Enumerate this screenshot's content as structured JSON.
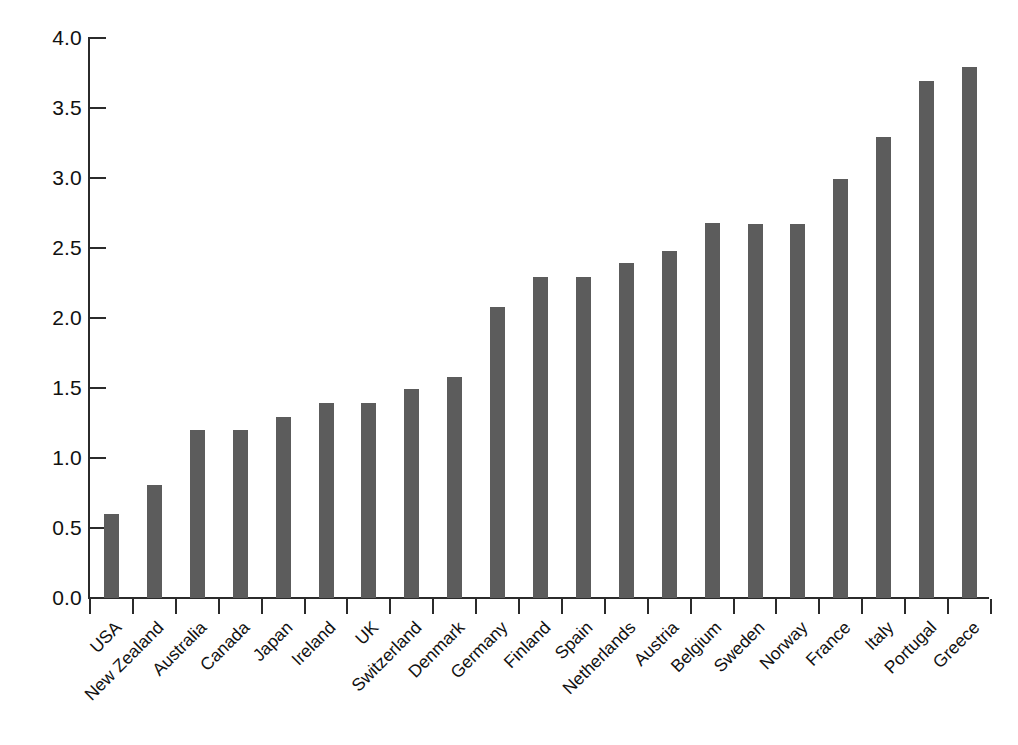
{
  "chart_data": {
    "type": "bar",
    "title": "",
    "subtitle": "",
    "xlabel": "",
    "ylabel": "",
    "ylim": [
      0.0,
      4.0
    ],
    "ytick_labels": [
      "0.0",
      "0.5",
      "1.0",
      "1.5",
      "2.0",
      "2.5",
      "3.0",
      "3.5",
      "4.0"
    ],
    "ytick_values": [
      0.0,
      0.5,
      1.0,
      1.5,
      2.0,
      2.5,
      3.0,
      3.5,
      4.0
    ],
    "grid": false,
    "legend": false,
    "legend_position": "none",
    "bar_color": "#5c5c5c",
    "axis_color": "#2b2b2b",
    "background_color": "#ffffff",
    "categories": [
      "USA",
      "New Zealand",
      "Australia",
      "Canada",
      "Japan",
      "Ireland",
      "UK",
      "Switzerland",
      "Denmark",
      "Germany",
      "Finland",
      "Spain",
      "Netherlands",
      "Austria",
      "Belgium",
      "Sweden",
      "Norway",
      "France",
      "Italy",
      "Portugal",
      "Greece"
    ],
    "values": [
      0.6,
      0.81,
      1.2,
      1.2,
      1.29,
      1.39,
      1.39,
      1.49,
      1.58,
      2.08,
      2.29,
      2.29,
      2.39,
      2.48,
      2.68,
      2.67,
      2.67,
      2.99,
      3.29,
      3.69,
      3.79
    ]
  }
}
